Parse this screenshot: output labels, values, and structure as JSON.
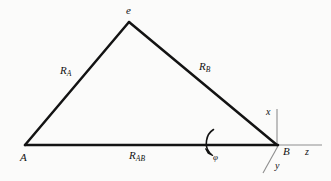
{
  "figure": {
    "background_color": "#fbfbfa",
    "ink_color": "#121212",
    "axis_color": "#8e8e8e",
    "width": 331,
    "height": 181
  },
  "labels": {
    "apex": "e",
    "side_left": {
      "base": "R",
      "sub": "A"
    },
    "side_right": {
      "base": "R",
      "sub": "B"
    },
    "baseline": {
      "base": "R",
      "sub": "AB"
    },
    "vertex_a": "A",
    "vertex_b": "B",
    "axis_x": "x",
    "axis_y": "y",
    "axis_z": "z",
    "rotation_angle": "φ"
  },
  "geometry": {
    "points": {
      "A": [
        25,
        145
      ],
      "e": [
        129,
        22
      ],
      "B": [
        277,
        145
      ]
    },
    "edges": [
      {
        "name": "R_A",
        "from": "A",
        "to": "e"
      },
      {
        "name": "R_B",
        "from": "e",
        "to": "B"
      },
      {
        "name": "R_AB",
        "from": "A",
        "to": "B"
      }
    ],
    "axes": [
      {
        "name": "x",
        "from": [
          277,
          145
        ],
        "to": [
          277,
          110
        ]
      },
      {
        "name": "z",
        "from": [
          277,
          145
        ],
        "to": [
          321,
          145
        ]
      },
      {
        "name": "y",
        "from": [
          277,
          145
        ],
        "to": [
          264,
          172
        ]
      }
    ],
    "rotation_arc": {
      "name": "phi",
      "start": [
        213,
        130
      ],
      "end": [
        209,
        152
      ],
      "sweep": "counterclockwise-left-bulge",
      "arrowhead_at": [
        210,
        153
      ]
    }
  }
}
